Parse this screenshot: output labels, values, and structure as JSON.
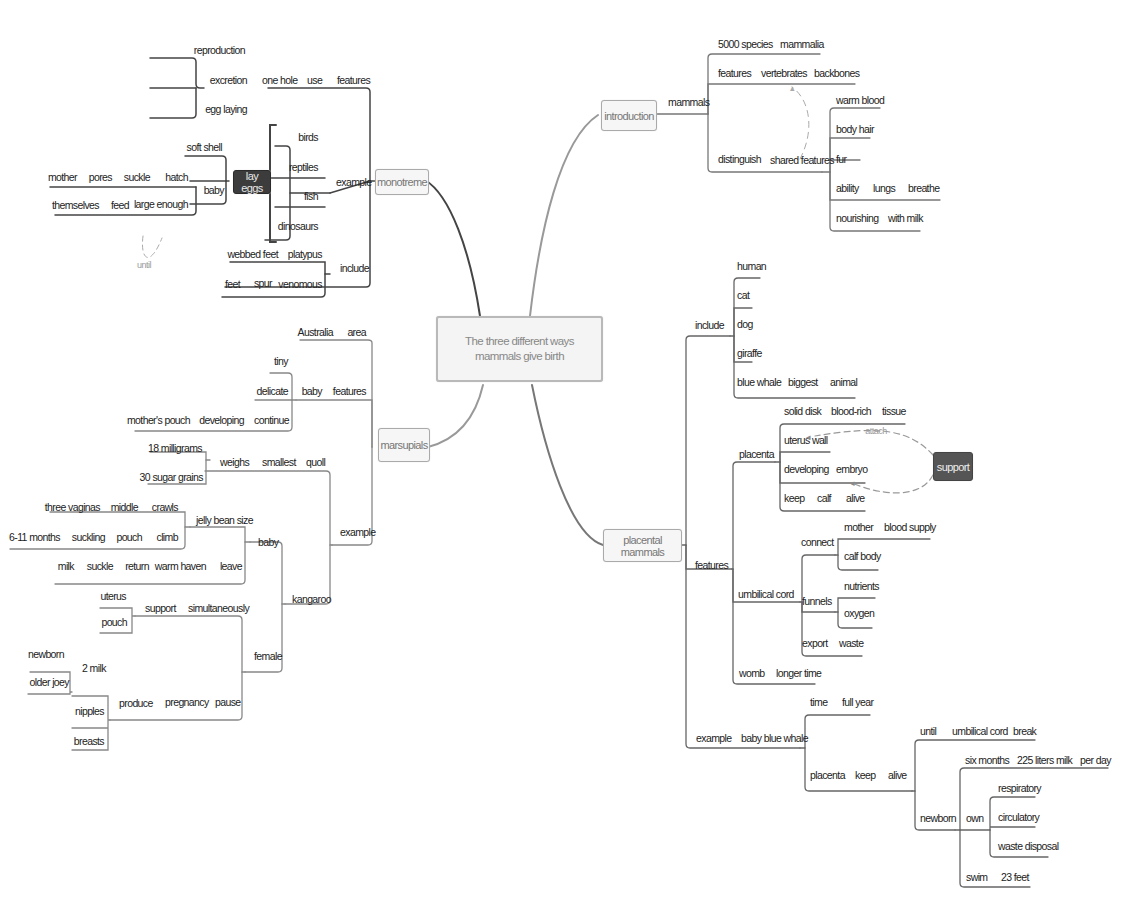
{
  "central": {
    "title": "The three different ways mammals give birth"
  },
  "branches": {
    "monotreme": {
      "label": "monotreme",
      "features": {
        "chain": [
          "one hole",
          "use",
          "features"
        ],
        "children": [
          "reproduction",
          "excretion",
          "egg laying"
        ]
      },
      "example": {
        "label": "example",
        "children": [
          "birds",
          "reptiles",
          "fish",
          "dinosaurs"
        ],
        "lay_eggs": "lay eggs",
        "soft_shell": "soft shell",
        "baby": "baby",
        "baby_chain_1": [
          "mother",
          "pores",
          "suckle",
          "hatch"
        ],
        "baby_chain_2": [
          "themselves",
          "feed",
          "large enough"
        ],
        "relation": "until"
      },
      "include": {
        "label": "include",
        "chain_1": [
          "webbed feet",
          "platypus"
        ],
        "chain_2": [
          "feet",
          "spur",
          "venomous"
        ]
      }
    },
    "marsupials": {
      "label": "marsupials",
      "area": [
        "Australia",
        "area"
      ],
      "features": {
        "chain": [
          "baby",
          "features"
        ],
        "children": [
          "tiny",
          "delicate"
        ],
        "continue_chain": [
          "mother's pouch",
          "developing",
          "continue"
        ]
      },
      "example": {
        "label": "example",
        "quoll": {
          "chain": [
            "weighs",
            "smallest",
            "quoll"
          ],
          "children": [
            "18 milligrams",
            "30 sugar grains"
          ]
        },
        "kangaroo": {
          "label": "kangaroo",
          "baby": {
            "label": "baby",
            "jelly": "jelly bean size",
            "chain_1": [
              "three vaginas",
              "middle",
              "crawls"
            ],
            "chain_2": [
              "6-11 months",
              "suckling",
              "pouch",
              "climb"
            ],
            "chain_3": [
              "milk",
              "suckle",
              "return",
              "warm haven",
              "leave"
            ]
          },
          "female": {
            "label": "female",
            "support_chain": [
              "support",
              "simultaneously"
            ],
            "support_children": [
              "uterus",
              "pouch"
            ],
            "pause_chain": [
              "produce",
              "pregnancy",
              "pause"
            ],
            "produce_children": [
              "2 milk",
              "nipples",
              "breasts"
            ],
            "milk_children": [
              "newborn",
              "older joey"
            ]
          }
        }
      }
    },
    "introduction": {
      "label": "introduction",
      "mammals": "mammals",
      "species_chain": [
        "5000 species",
        "mammalia"
      ],
      "features_chain": [
        "features",
        "vertebrates",
        "backbones"
      ],
      "distinguish_chain": [
        "distinguish",
        "shared features"
      ],
      "shared_children": [
        "warm blood",
        "body hair",
        "fur"
      ],
      "ability_chain": [
        "ability",
        "lungs",
        "breathe"
      ],
      "nourishing_chain": [
        "nourishing",
        "with milk"
      ]
    },
    "placental": {
      "label": "placental mammals",
      "include": {
        "label": "include",
        "children": [
          "human",
          "cat",
          "dog",
          "giraffe"
        ],
        "whale_chain": [
          "blue whale",
          "biggest",
          "animal"
        ]
      },
      "features": {
        "label": "features",
        "placenta": {
          "label": "placenta",
          "chain_1": [
            "solid disk",
            "blood-rich",
            "tissue"
          ],
          "uterus_wall": "uterus wall",
          "chain_2": [
            "developing",
            "embryo"
          ],
          "chain_3": [
            "keep",
            "calf",
            "alive"
          ]
        },
        "umbilical": {
          "label": "umbilical cord",
          "connect": "connect",
          "connect_chain": [
            "mother",
            "blood supply"
          ],
          "calf_body": "calf body",
          "funnels": "funnels",
          "funnels_children": [
            "nutrients",
            "oxygen"
          ],
          "export_chain": [
            "export",
            "waste"
          ]
        },
        "womb_chain": [
          "womb",
          "longer time"
        ]
      },
      "example": {
        "chain": [
          "example",
          "baby blue whale"
        ],
        "time_chain": [
          "time",
          "full year"
        ],
        "alive_chain": [
          "placenta",
          "keep",
          "alive"
        ],
        "until_chain": [
          "until",
          "umbilical cord",
          "break"
        ],
        "newborn": "newborn",
        "six_chain": [
          "six months",
          "225 liters milk",
          "per day"
        ],
        "own": "own",
        "own_children": [
          "respiratory",
          "circulatory",
          "waste disposal"
        ],
        "swim_chain": [
          "swim",
          "23 feet"
        ]
      }
    }
  },
  "floating": {
    "support": "support",
    "attach": "attach"
  },
  "colors": {
    "line": "#555555",
    "line_light": "#9a9a9a",
    "dark_node": "#3c3c3c",
    "support_node": "#555555"
  }
}
